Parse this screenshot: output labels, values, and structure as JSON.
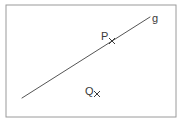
{
  "figure": {
    "background_color": "#ffffff",
    "frame": {
      "x": 6,
      "y": 5,
      "width": 170,
      "height": 112,
      "stroke_color": "#9a9a9a",
      "stroke_width": 1,
      "fill_color": "#ffffff"
    },
    "line": {
      "name": "g",
      "label": "g",
      "label_x": 152,
      "label_y": 22,
      "x1": 22,
      "y1": 98,
      "x2": 150,
      "y2": 17,
      "stroke_color": "#555555",
      "stroke_width": 1
    },
    "points": [
      {
        "name": "P",
        "label": "P",
        "label_x": 101,
        "label_y": 40,
        "marker_x": 112,
        "marker_y": 41,
        "marker_size": 3,
        "marker_glyph": "x",
        "on_line": true,
        "color": "#3a3a3a"
      },
      {
        "name": "Q",
        "label": "Q",
        "label_x": 85,
        "label_y": 95,
        "marker_x": 97,
        "marker_y": 94,
        "marker_size": 3,
        "marker_glyph": "x",
        "on_line": false,
        "color": "#3a3a3a"
      }
    ]
  }
}
